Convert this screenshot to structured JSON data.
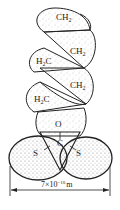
{
  "diagram": {
    "type": "molecular-model",
    "atoms": {
      "ch2_top": {
        "main": "CH",
        "sub": "2"
      },
      "ch2_right_1": {
        "main": "CH",
        "sub": "2"
      },
      "h3c_left_1": {
        "main": "H",
        "sub": "2",
        "tail": "C"
      },
      "ch2_right_2": {
        "main": "CH",
        "sub": "2"
      },
      "h3c_left_2": {
        "main": "H",
        "sub": "2",
        "tail": "C"
      },
      "oxygen": "O",
      "carbon": "C",
      "sulfur_left": "S",
      "sulfur_right": "S"
    },
    "dimension": {
      "base": "7×10",
      "exponent": "−10",
      "unit": "m"
    },
    "colors": {
      "outline": "#222222",
      "stipple": "#8a8a8a",
      "background": "#ffffff"
    }
  }
}
